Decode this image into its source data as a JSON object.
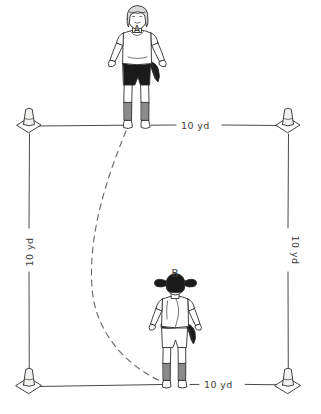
{
  "diagram": {
    "background_color": "#ffffff",
    "ink_color": "#2e2e2e",
    "line_color": "#4a4a48",
    "path_color": "#6a6a68"
  },
  "labels": {
    "top_distance": "10 yd",
    "bottom_distance": "10 yd",
    "left_distance": "10 yd",
    "right_distance": "10 yd",
    "player_a": "A",
    "player_b": "B"
  },
  "players": [
    {
      "id": "A",
      "label": "A",
      "facing": "front",
      "hair": "light-bob-with-headband",
      "top": "white",
      "shorts": "dark",
      "socks": "grey",
      "shoes": "white",
      "x": 137,
      "y": 125
    },
    {
      "id": "B",
      "label": "B",
      "facing": "back",
      "hair": "dark-pigtails",
      "top": "white",
      "waist": "dark-tied-sweater",
      "shorts": "white",
      "socks": "grey",
      "shoes": "white",
      "x": 175,
      "y": 385
    }
  ],
  "cones": [
    {
      "position": "top-left",
      "x": 29,
      "y": 125
    },
    {
      "position": "top-right",
      "x": 288,
      "y": 125
    },
    {
      "position": "bottom-left",
      "x": 29,
      "y": 385
    },
    {
      "position": "bottom-right",
      "x": 288,
      "y": 385
    }
  ],
  "field": {
    "left": 29,
    "right": 288,
    "top": 125,
    "bottom": 385,
    "shape": "square",
    "side_length": "10 yd"
  },
  "run_path": {
    "style": "dashed-curve",
    "from": "A",
    "to": "B",
    "description": "curved dashed running path bowing left from player A down to player B"
  }
}
